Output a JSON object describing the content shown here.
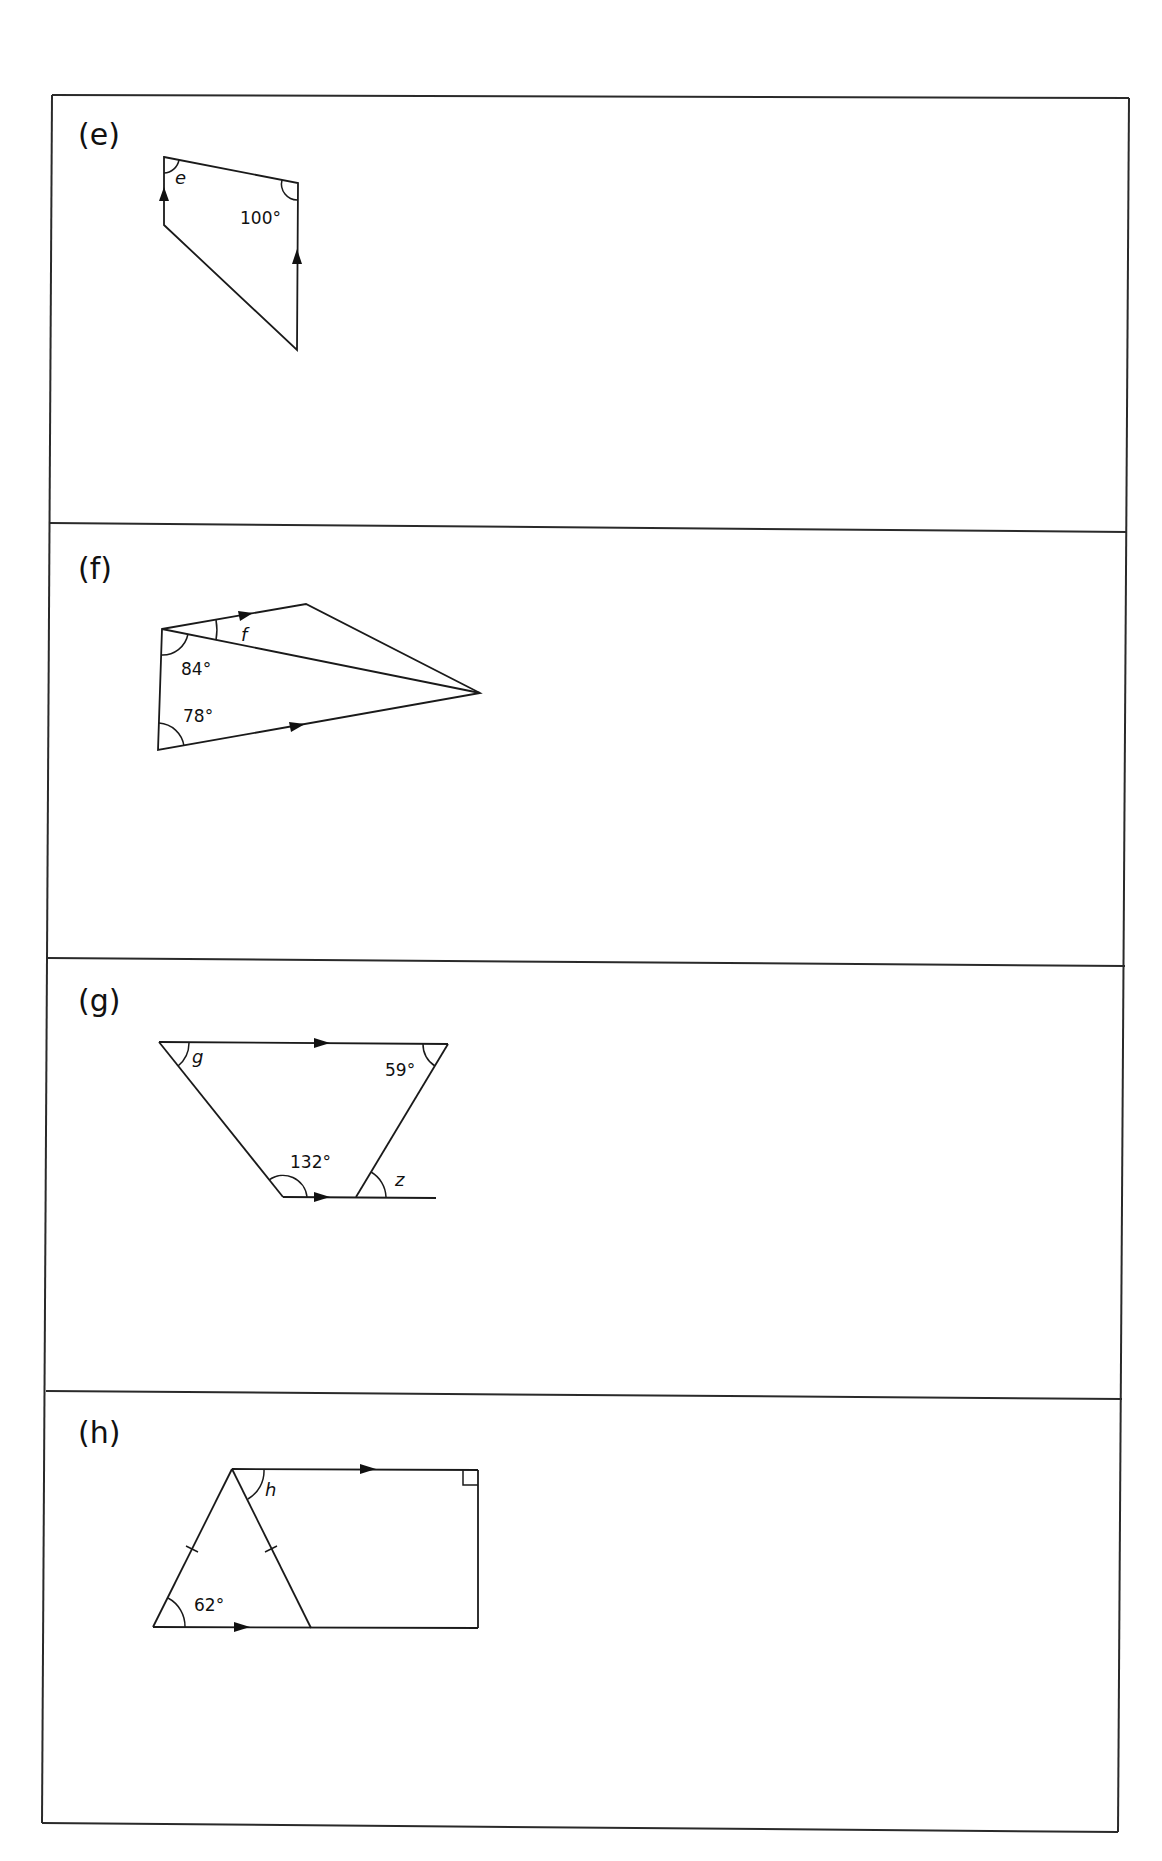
{
  "page": {
    "background": "#ffffff",
    "ink_color": "#111111"
  },
  "panels": [
    {
      "part_label": "(e)",
      "figure": "quadrilateral-with-parallel-verticals",
      "labels": {
        "unknown": "e",
        "given_angle": "100°"
      }
    },
    {
      "part_label": "(f)",
      "figure": "quadrilateral-with-diagonal",
      "labels": {
        "unknown": "f",
        "given_angle_1": "84°",
        "given_angle_2": "78°"
      }
    },
    {
      "part_label": "(g)",
      "figure": "trapezium-with-extended-base",
      "labels": {
        "unknown_1": "g",
        "unknown_2": "z",
        "given_angle_1": "59°",
        "given_angle_2": "132°"
      }
    },
    {
      "part_label": "(h)",
      "figure": "isosceles-triangle-and-right-angled-trapezium",
      "labels": {
        "unknown": "h",
        "given_angle": "62°"
      }
    }
  ]
}
